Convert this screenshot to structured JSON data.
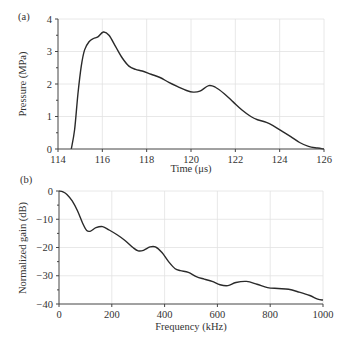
{
  "chart_data": [
    {
      "panel": "(a)",
      "type": "line",
      "title": "",
      "xlabel": "Time (μs)",
      "ylabel": "Pressure (MPa)",
      "xlim": [
        114,
        126
      ],
      "ylim": [
        0,
        4
      ],
      "xticks": [
        114,
        116,
        118,
        120,
        122,
        124,
        126
      ],
      "yticks": [
        0,
        1,
        2,
        3,
        4
      ],
      "grid": true,
      "series": [
        {
          "name": "pressure",
          "color": "#2a2a2a",
          "x": [
            114.6,
            114.75,
            114.9,
            115.05,
            115.2,
            115.4,
            115.6,
            115.8,
            116.05,
            116.3,
            116.6,
            116.9,
            117.2,
            117.5,
            117.8,
            118.2,
            118.6,
            119.0,
            119.4,
            119.8,
            120.1,
            120.4,
            120.8,
            121.1,
            121.5,
            121.9,
            122.3,
            122.7,
            123.0,
            123.4,
            123.7,
            124.1,
            124.5,
            124.9,
            125.3,
            125.7,
            126.0
          ],
          "y": [
            0,
            0.6,
            1.7,
            2.55,
            3.05,
            3.3,
            3.4,
            3.45,
            3.6,
            3.5,
            3.15,
            2.8,
            2.55,
            2.45,
            2.4,
            2.3,
            2.2,
            2.05,
            1.92,
            1.8,
            1.75,
            1.78,
            1.95,
            1.9,
            1.7,
            1.45,
            1.2,
            1.0,
            0.9,
            0.82,
            0.72,
            0.55,
            0.38,
            0.2,
            0.08,
            0.03,
            0.0
          ]
        }
      ]
    },
    {
      "panel": "(b)",
      "type": "line",
      "title": "",
      "xlabel": "Frequency (kHz)",
      "ylabel": "Normalized gain (dB)",
      "xlim": [
        0,
        1000
      ],
      "ylim": [
        -40,
        0
      ],
      "xticks": [
        0,
        200,
        400,
        600,
        800,
        1000
      ],
      "yticks": [
        0,
        -10,
        -20,
        -30,
        -40
      ],
      "grid": true,
      "series": [
        {
          "name": "gain",
          "color": "#2a2a2a",
          "x": [
            0,
            15,
            30,
            50,
            70,
            90,
            105,
            120,
            140,
            165,
            190,
            220,
            250,
            280,
            300,
            320,
            345,
            365,
            390,
            415,
            440,
            460,
            490,
            520,
            550,
            580,
            610,
            640,
            670,
            710,
            750,
            790,
            830,
            870,
            910,
            950,
            980,
            1000
          ],
          "y": [
            0,
            -0.3,
            -1.2,
            -3.5,
            -7.0,
            -11.5,
            -14.0,
            -14.2,
            -13.0,
            -12.6,
            -13.8,
            -15.5,
            -17.5,
            -20.0,
            -21.2,
            -21.0,
            -19.8,
            -19.8,
            -21.8,
            -25.0,
            -27.5,
            -28.2,
            -28.8,
            -30.3,
            -31.2,
            -32.0,
            -33.2,
            -33.5,
            -32.4,
            -32.0,
            -33.0,
            -34.2,
            -34.5,
            -34.8,
            -35.8,
            -37.0,
            -38.3,
            -38.6
          ]
        }
      ]
    }
  ],
  "panels": {
    "a": {
      "label": "(a)",
      "xlabel": "Time (μs)",
      "ylabel": "Pressure (MPa)",
      "xticks": [
        "114",
        "116",
        "118",
        "120",
        "122",
        "124",
        "126"
      ],
      "yticks": [
        "0",
        "1",
        "2",
        "3",
        "4"
      ]
    },
    "b": {
      "label": "(b)",
      "xlabel": "Frequency (kHz)",
      "ylabel": "Normalized gain (dB)",
      "xticks": [
        "0",
        "200",
        "400",
        "600",
        "800",
        "1000"
      ],
      "yticks": [
        "0",
        "−10",
        "−20",
        "−30",
        "−40"
      ]
    }
  }
}
